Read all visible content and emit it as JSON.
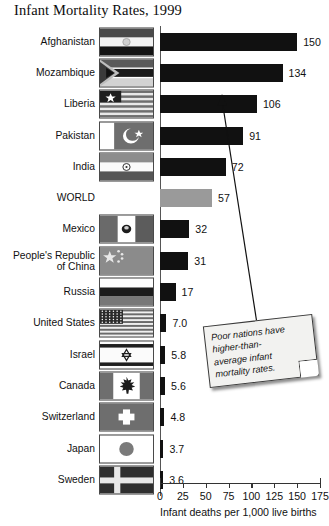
{
  "title": "Infant Mortality Rates, 1999",
  "axis": {
    "label": "Infant deaths per 1,000 live births",
    "ticks": [
      0,
      25,
      50,
      75,
      100,
      125,
      150,
      175
    ],
    "min": 0,
    "max": 175
  },
  "callout": {
    "lines": [
      "Poor nations have",
      "higher-than-",
      "average infant",
      "mortality rates."
    ],
    "text": "Poor nations have higher-than-average infant mortality rates."
  },
  "colors": {
    "bar": "#111111",
    "world_bar": "#9a9a9a",
    "axis": "#333333",
    "note_bg": "#f2f2f0"
  },
  "chart_data": {
    "type": "bar",
    "title": "Infant Mortality Rates, 1999",
    "xlabel": "Infant deaths per 1,000 live births",
    "ylabel": "",
    "xlim": [
      0,
      175
    ],
    "orientation": "horizontal",
    "grid": false,
    "legend": "none",
    "categories": [
      "Afghanistan",
      "Mozambique",
      "Liberia",
      "Pakistan",
      "India",
      "WORLD",
      "Mexico",
      "People's Republic of China",
      "Russia",
      "United States",
      "Israel",
      "Canada",
      "Switzerland",
      "Japan",
      "Sweden"
    ],
    "values": [
      150,
      134,
      106,
      91,
      72,
      57,
      32,
      31,
      17,
      7.0,
      5.8,
      5.6,
      4.8,
      3.7,
      3.6
    ],
    "value_labels": [
      "150",
      "134",
      "106",
      "91",
      "72",
      "57",
      "32",
      "31",
      "17",
      "7.0",
      "5.8",
      "5.6",
      "4.8",
      "3.7",
      "3.6"
    ]
  },
  "rows": [
    {
      "label": "Afghanistan",
      "value": 150,
      "value_label": "150",
      "flag": "flag-afghanistan",
      "highlight": false
    },
    {
      "label": "Mozambique",
      "value": 134,
      "value_label": "134",
      "flag": "flag-mozambique",
      "highlight": false
    },
    {
      "label": "Liberia",
      "value": 106,
      "value_label": "106",
      "flag": "flag-liberia",
      "highlight": false
    },
    {
      "label": "Pakistan",
      "value": 91,
      "value_label": "91",
      "flag": "flag-pakistan",
      "highlight": false
    },
    {
      "label": "India",
      "value": 72,
      "value_label": "72",
      "flag": "flag-india",
      "highlight": false
    },
    {
      "label": "WORLD",
      "value": 57,
      "value_label": "57",
      "flag": "",
      "highlight": true
    },
    {
      "label": "Mexico",
      "value": 32,
      "value_label": "32",
      "flag": "flag-mexico",
      "highlight": false
    },
    {
      "label": "People's Republic\nof China",
      "value": 31,
      "value_label": "31",
      "flag": "flag-china",
      "highlight": false
    },
    {
      "label": "Russia",
      "value": 17,
      "value_label": "17",
      "flag": "flag-russia",
      "highlight": false
    },
    {
      "label": "United States",
      "value": 7.0,
      "value_label": "7.0",
      "flag": "flag-united-states",
      "highlight": false
    },
    {
      "label": "Israel",
      "value": 5.8,
      "value_label": "5.8",
      "flag": "flag-israel",
      "highlight": false
    },
    {
      "label": "Canada",
      "value": 5.6,
      "value_label": "5.6",
      "flag": "flag-canada",
      "highlight": false
    },
    {
      "label": "Switzerland",
      "value": 4.8,
      "value_label": "4.8",
      "flag": "flag-switzerland",
      "highlight": false
    },
    {
      "label": "Japan",
      "value": 3.7,
      "value_label": "3.7",
      "flag": "flag-japan",
      "highlight": false
    },
    {
      "label": "Sweden",
      "value": 3.6,
      "value_label": "3.6",
      "flag": "flag-sweden",
      "highlight": false
    }
  ]
}
